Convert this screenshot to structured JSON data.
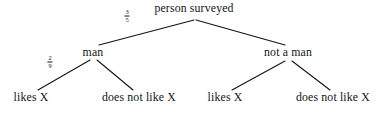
{
  "diagram": {
    "type": "probability-tree",
    "background_color": "#ffffff",
    "line_color": "#141414",
    "text_color": "#141414",
    "levels": 3
  },
  "nodes": {
    "root": {
      "label": "person surveyed",
      "x": 194,
      "y": 10
    },
    "level2": [
      {
        "id": "man",
        "label": "man",
        "x": 93,
        "y": 54
      },
      {
        "id": "not-a-man",
        "label": "not a man",
        "x": 288,
        "y": 54
      }
    ],
    "leaves": [
      {
        "id": "man-likes",
        "label": "likes X",
        "x": 31,
        "y": 99
      },
      {
        "id": "man-not-likes",
        "label": "does not like X",
        "x": 139,
        "y": 99
      },
      {
        "id": "notman-likes",
        "label": "likes X",
        "x": 225,
        "y": 99
      },
      {
        "id": "notman-not-likes",
        "label": "does not like X",
        "x": 333,
        "y": 99
      }
    ]
  },
  "branch_labels": [
    {
      "id": "root-to-man",
      "numerator": "3",
      "denominator": "5",
      "x": 127,
      "y": 16
    },
    {
      "id": "man-to-likes",
      "numerator": "2",
      "denominator": "9",
      "x": 50,
      "y": 62
    }
  ],
  "edges": [
    {
      "id": "root-man",
      "from": "root",
      "to": "man",
      "x1": 194,
      "y1": 20,
      "x2": 99,
      "y2": 45
    },
    {
      "id": "root-not-a-man",
      "from": "root",
      "to": "not-a-man",
      "x1": 196,
      "y1": 20,
      "x2": 285,
      "y2": 45
    },
    {
      "id": "man-likes",
      "from": "man",
      "to": "man-likes",
      "x1": 90,
      "y1": 60,
      "x2": 38,
      "y2": 90
    },
    {
      "id": "man-does-not-like",
      "from": "man",
      "to": "man-not-likes",
      "x1": 97,
      "y1": 60,
      "x2": 133,
      "y2": 90
    },
    {
      "id": "notman-likes",
      "from": "not-a-man",
      "to": "notman-likes",
      "x1": 285,
      "y1": 61,
      "x2": 232,
      "y2": 90
    },
    {
      "id": "notman-does-not-like",
      "from": "not-a-man",
      "to": "notman-not-likes",
      "x1": 292,
      "y1": 61,
      "x2": 330,
      "y2": 90
    }
  ]
}
